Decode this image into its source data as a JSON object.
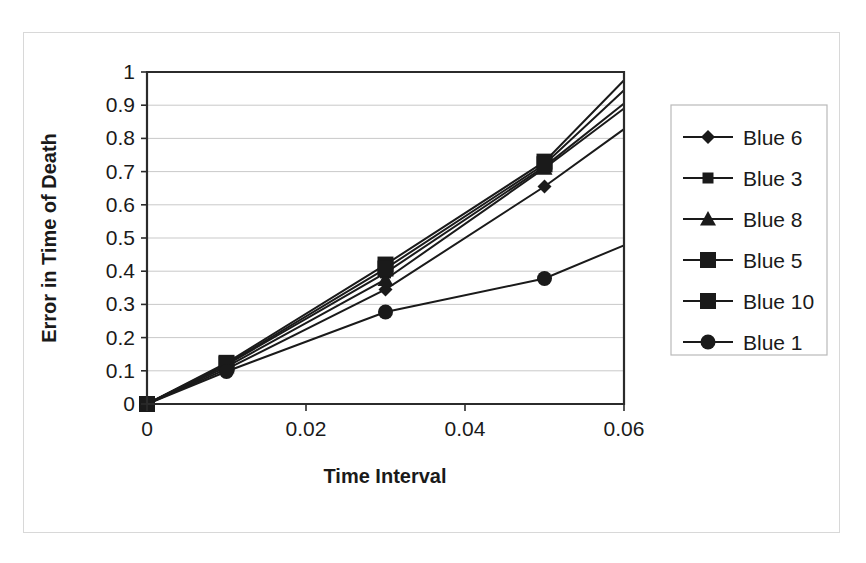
{
  "chart_data": {
    "type": "line",
    "title": "",
    "xlabel": "Time Interval",
    "ylabel": "Error in Time of Death",
    "x": [
      0,
      0.01,
      0.03,
      0.05,
      0.06
    ],
    "xlim": [
      0,
      0.06
    ],
    "ylim": [
      0,
      1
    ],
    "xticks": [
      "0",
      "0.02",
      "0.04",
      "0.06"
    ],
    "xtick_values": [
      0,
      0.02,
      0.04,
      0.06
    ],
    "yticks": [
      "0",
      "0.1",
      "0.2",
      "0.3",
      "0.4",
      "0.5",
      "0.6",
      "0.7",
      "0.8",
      "0.9",
      "1"
    ],
    "ytick_values": [
      0,
      0.1,
      0.2,
      0.3,
      0.4,
      0.5,
      0.6,
      0.7,
      0.8,
      0.9,
      1
    ],
    "grid": true,
    "legend_position": "right",
    "series": [
      {
        "name": "Blue 6",
        "marker": "diamond",
        "values": [
          0,
          0.105,
          0.345,
          0.655,
          0.828
        ]
      },
      {
        "name": "Blue 3",
        "marker": "square",
        "values": [
          0,
          0.118,
          0.395,
          0.715,
          0.905
        ]
      },
      {
        "name": "Blue 8",
        "marker": "triangle",
        "values": [
          0,
          0.112,
          0.375,
          0.71,
          0.89
        ]
      },
      {
        "name": "Blue 5",
        "marker": "large-square",
        "values": [
          0,
          0.124,
          0.42,
          0.73,
          0.975
        ]
      },
      {
        "name": "Blue 10",
        "marker": "large-square",
        "values": [
          0,
          0.12,
          0.408,
          0.722,
          0.945
        ]
      },
      {
        "name": "Blue 1",
        "marker": "circle",
        "values": [
          0,
          0.098,
          0.277,
          0.378,
          0.478
        ]
      }
    ]
  },
  "legend": {
    "entries": [
      {
        "label": "Blue 6",
        "marker": "diamond"
      },
      {
        "label": "Blue 3",
        "marker": "square"
      },
      {
        "label": "Blue 8",
        "marker": "triangle"
      },
      {
        "label": "Blue 5",
        "marker": "large-square"
      },
      {
        "label": "Blue 10",
        "marker": "large-square"
      },
      {
        "label": "Blue 1",
        "marker": "circle"
      }
    ]
  },
  "colors": {
    "series": "#1a1a1a",
    "grid": "#c9c9c9",
    "axis": "#2b2b2b",
    "background": "#ffffff"
  }
}
